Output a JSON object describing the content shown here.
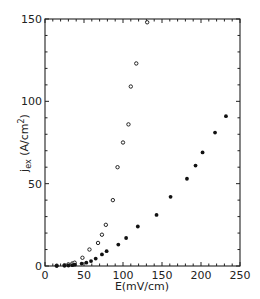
{
  "chart_data": {
    "type": "scatter",
    "title": "",
    "xlabel": "E(mV/cm)",
    "ylabel": "j_ex (A/cm^2)",
    "ylabel_main": "j",
    "ylabel_sub": "ex",
    "ylabel_unit": " (A/cm",
    "ylabel_sup": "2",
    "ylabel_close": ")",
    "xlim": [
      0,
      250
    ],
    "ylim": [
      0,
      150
    ],
    "x_ticks": [
      0,
      50,
      100,
      150,
      200,
      250
    ],
    "y_ticks": [
      0,
      50,
      100,
      150
    ],
    "x_minor_step": 10,
    "y_minor_step": 10,
    "grid": false,
    "legend": "none",
    "series": [
      {
        "name": "open circles",
        "marker": "open-circle",
        "points": [
          [
            15,
            0.2
          ],
          [
            25,
            0.5
          ],
          [
            30,
            1
          ],
          [
            35,
            1.5
          ],
          [
            38,
            2
          ],
          [
            48,
            5
          ],
          [
            57,
            10
          ],
          [
            68,
            14
          ],
          [
            73,
            19
          ],
          [
            78,
            25
          ],
          [
            87,
            40
          ],
          [
            93,
            60
          ],
          [
            100,
            75
          ],
          [
            107,
            86
          ],
          [
            110,
            109
          ],
          [
            117,
            123
          ],
          [
            131,
            148
          ]
        ]
      },
      {
        "name": "filled circles",
        "marker": "filled-circle",
        "points": [
          [
            15,
            0.1
          ],
          [
            25,
            0.2
          ],
          [
            30,
            0.3
          ],
          [
            35,
            0.5
          ],
          [
            38,
            0.8
          ],
          [
            47,
            1.5
          ],
          [
            53,
            2
          ],
          [
            59,
            3
          ],
          [
            65,
            4.5
          ],
          [
            73,
            7
          ],
          [
            79,
            9
          ],
          [
            94,
            13
          ],
          [
            104,
            17
          ],
          [
            119,
            24
          ],
          [
            143,
            31
          ],
          [
            161,
            42
          ],
          [
            182,
            53
          ],
          [
            193,
            61
          ],
          [
            202,
            69
          ],
          [
            218,
            81
          ],
          [
            232,
            91
          ]
        ]
      }
    ]
  }
}
